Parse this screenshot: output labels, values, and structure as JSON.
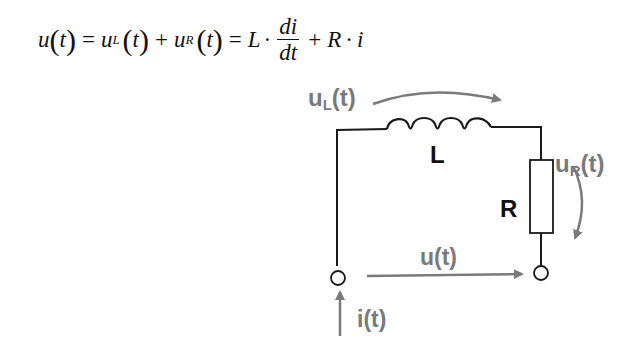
{
  "formula": {
    "lhs": "u",
    "t": "t",
    "eq": "=",
    "uL_base": "u",
    "uL_sub": "L",
    "plus": "+",
    "uR_base": "u",
    "uR_sub": "R",
    "L": "L",
    "dot": "·",
    "num": "di",
    "den": "dt",
    "R": "R",
    "i": "i"
  },
  "labels": {
    "uL": {
      "base": "u",
      "sub": "L",
      "arg": "(t)"
    },
    "uR": {
      "base": "u",
      "sub": "R",
      "arg": "(t)"
    },
    "inductor": "L",
    "resistor": "R",
    "u": "u(t)",
    "i": "i(t)"
  },
  "colors": {
    "wire": "#1a1a1a",
    "arrow": "#7a7a7a"
  }
}
